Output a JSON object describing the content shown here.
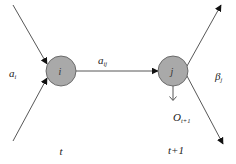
{
  "diagram": {
    "type": "state-transition",
    "nodes": [
      {
        "id": "i",
        "label": "i",
        "cx": 61,
        "cy": 71,
        "r": 15,
        "fill": "#a9a9a9",
        "stroke": "#555555"
      },
      {
        "id": "j",
        "label": "j",
        "cx": 173,
        "cy": 71,
        "r": 15,
        "fill": "#a9a9a9",
        "stroke": "#555555"
      }
    ],
    "edges": [
      {
        "id": "in-top",
        "from": "input",
        "to": "i",
        "label": ""
      },
      {
        "id": "in-bottom",
        "from": "input",
        "to": "i",
        "label": ""
      },
      {
        "id": "i-to-j",
        "from": "i",
        "to": "j",
        "label": "a",
        "label_sub": "ij"
      },
      {
        "id": "out-top",
        "from": "j",
        "to": "output",
        "label": ""
      },
      {
        "id": "out-bottom",
        "from": "j",
        "to": "output",
        "label": ""
      },
      {
        "id": "emission",
        "from": "j",
        "to": "observation",
        "label": "O",
        "label_sub": "t+1"
      }
    ],
    "labels": {
      "alpha_in": {
        "main": "a",
        "sub": "i"
      },
      "beta_out": {
        "main": "β",
        "sub": "j"
      },
      "transition": {
        "main": "a",
        "sub": "ij"
      },
      "observation": {
        "main": "O",
        "sub": "t+1"
      },
      "time_t": "t",
      "time_t1": "t+1"
    },
    "colors": {
      "line": "#444444",
      "arrowhead": "#111111",
      "node_fill": "#a9a9a9",
      "node_stroke": "#555555",
      "background": "#ffffff"
    }
  }
}
